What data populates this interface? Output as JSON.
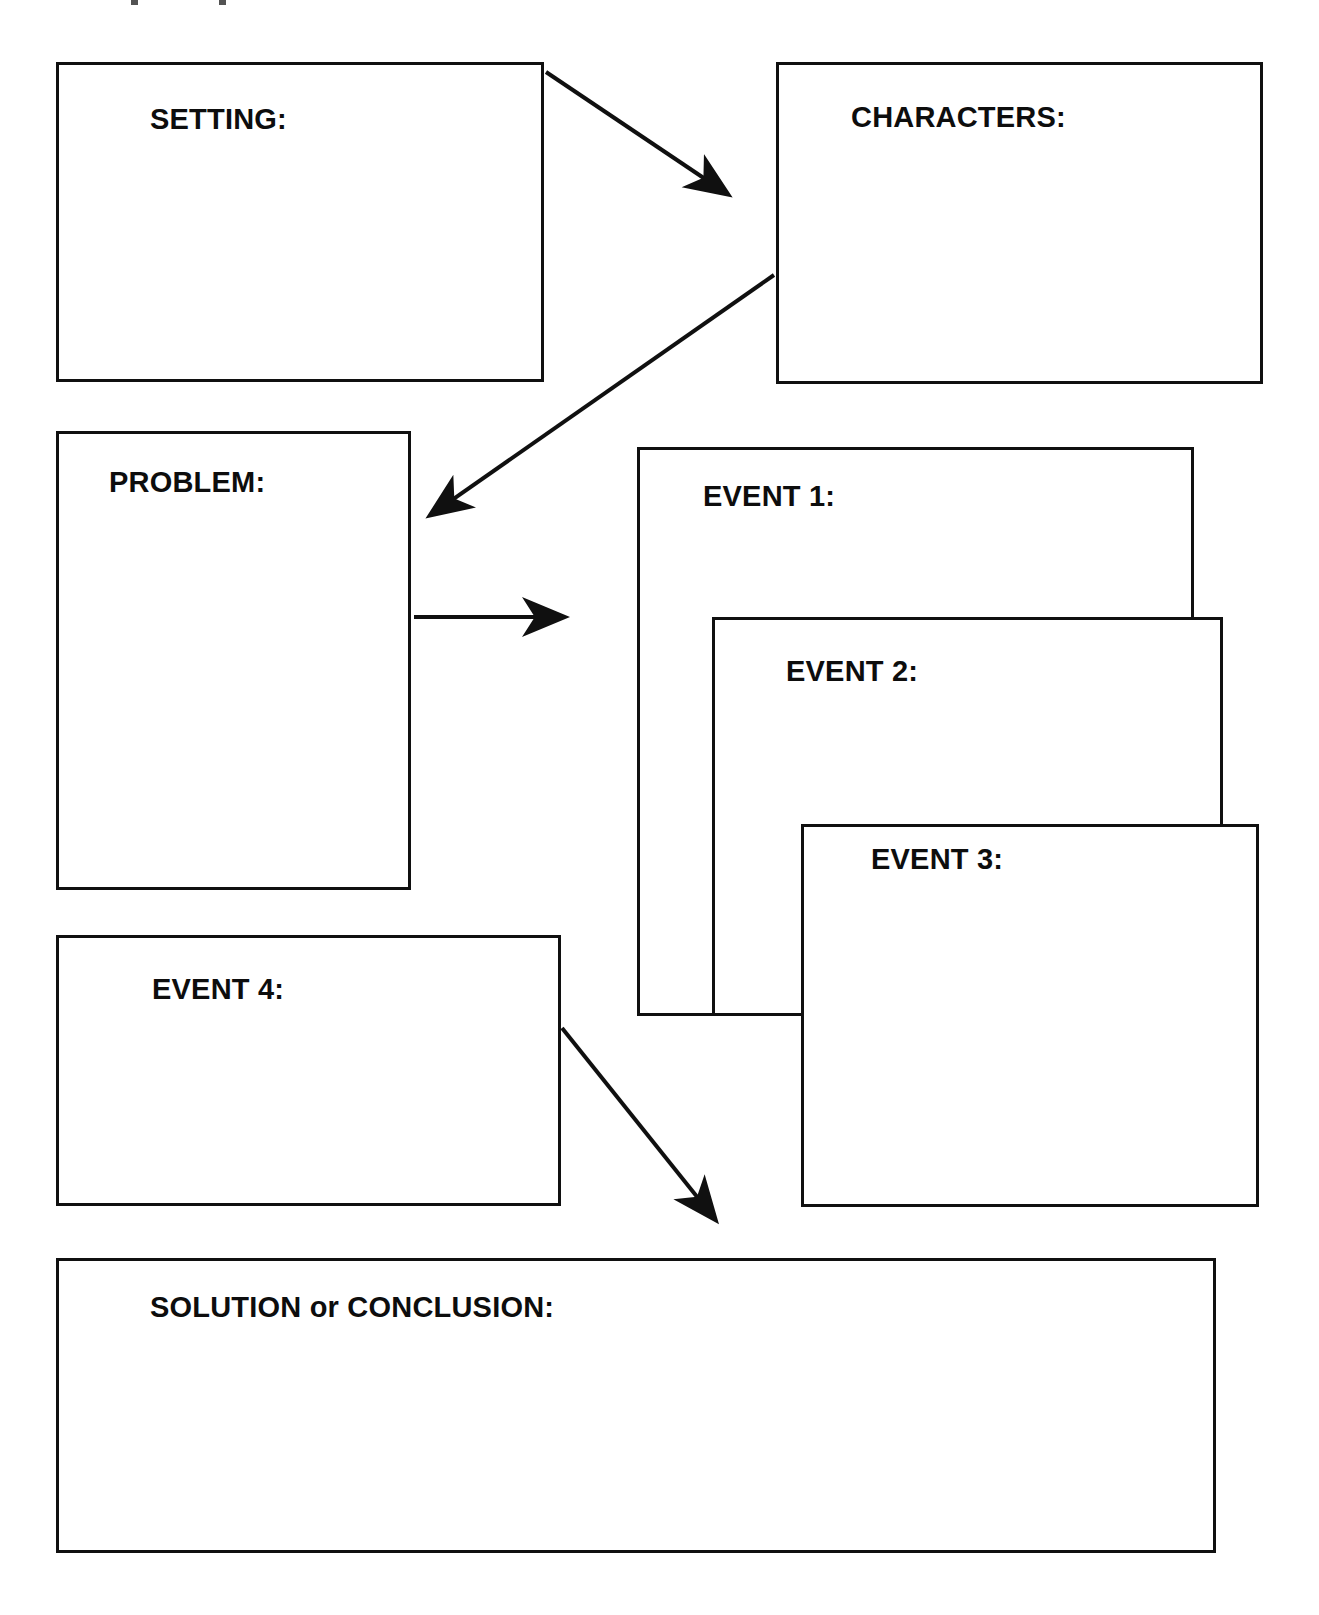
{
  "graphic_organizer": {
    "type": "story-map-graphic-organizer",
    "boxes": [
      {
        "id": "setting",
        "label": "SETTING:"
      },
      {
        "id": "characters",
        "label": "CHARACTERS:"
      },
      {
        "id": "problem",
        "label": "PROBLEM:"
      },
      {
        "id": "event1",
        "label": "EVENT 1:"
      },
      {
        "id": "event2",
        "label": "EVENT 2:"
      },
      {
        "id": "event3",
        "label": "EVENT 3:"
      },
      {
        "id": "event4",
        "label": "EVENT 4:"
      },
      {
        "id": "solution",
        "label": "SOLUTION or CONCLUSION:"
      }
    ],
    "arrows": [
      {
        "id": "setting-to-characters",
        "from": "setting",
        "to": "characters",
        "direction": "down-right"
      },
      {
        "id": "characters-to-problem",
        "from": "characters",
        "to": "problem",
        "direction": "down-left"
      },
      {
        "id": "problem-to-event1",
        "from": "problem",
        "to": "event1",
        "direction": "right"
      },
      {
        "id": "event4-to-solution",
        "from": "event4",
        "to": "solution",
        "direction": "down-right"
      }
    ],
    "colors": {
      "border": "#101010",
      "text": "#0d0d0d",
      "background": "#ffffff",
      "arrow": "#101010"
    }
  }
}
